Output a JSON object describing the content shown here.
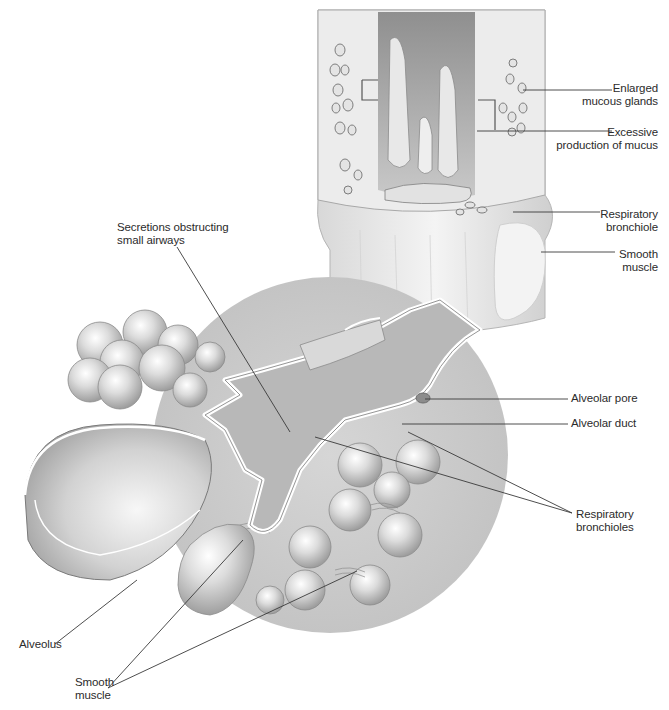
{
  "diagram": {
    "colors": {
      "background": "#ffffff",
      "tissue_light": "#e6e6e6",
      "tissue_mid": "#c8c8c8",
      "tissue_dark": "#9a9a9a",
      "circle_bg": "#cfcfcf",
      "outline": "#6e6e6e",
      "leader_line": "#3a3a3a",
      "text": "#2b2b2b"
    },
    "labels": {
      "enlarged_mucous_glands": {
        "line1": "Enlarged",
        "line2": "mucous glands"
      },
      "excessive_mucus": {
        "line1": "Excessive",
        "line2": "production of mucus"
      },
      "respiratory_bronchiole": {
        "line1": "Respiratory",
        "line2": "bronchiole"
      },
      "smooth_muscle_top": {
        "line1": "Smooth",
        "line2": "muscle"
      },
      "secretions": {
        "line1": "Secretions obstructing",
        "line2": "small airways"
      },
      "alveolar_pore": {
        "line1": "Alveolar pore"
      },
      "alveolar_duct": {
        "line1": "Alveolar duct"
      },
      "respiratory_bronchioles": {
        "line1": "Respiratory",
        "line2": "bronchioles"
      },
      "alveolus": {
        "line1": "Alveolus"
      },
      "smooth_muscle_bottom": {
        "line1": "Smooth",
        "line2": "muscle"
      }
    }
  }
}
